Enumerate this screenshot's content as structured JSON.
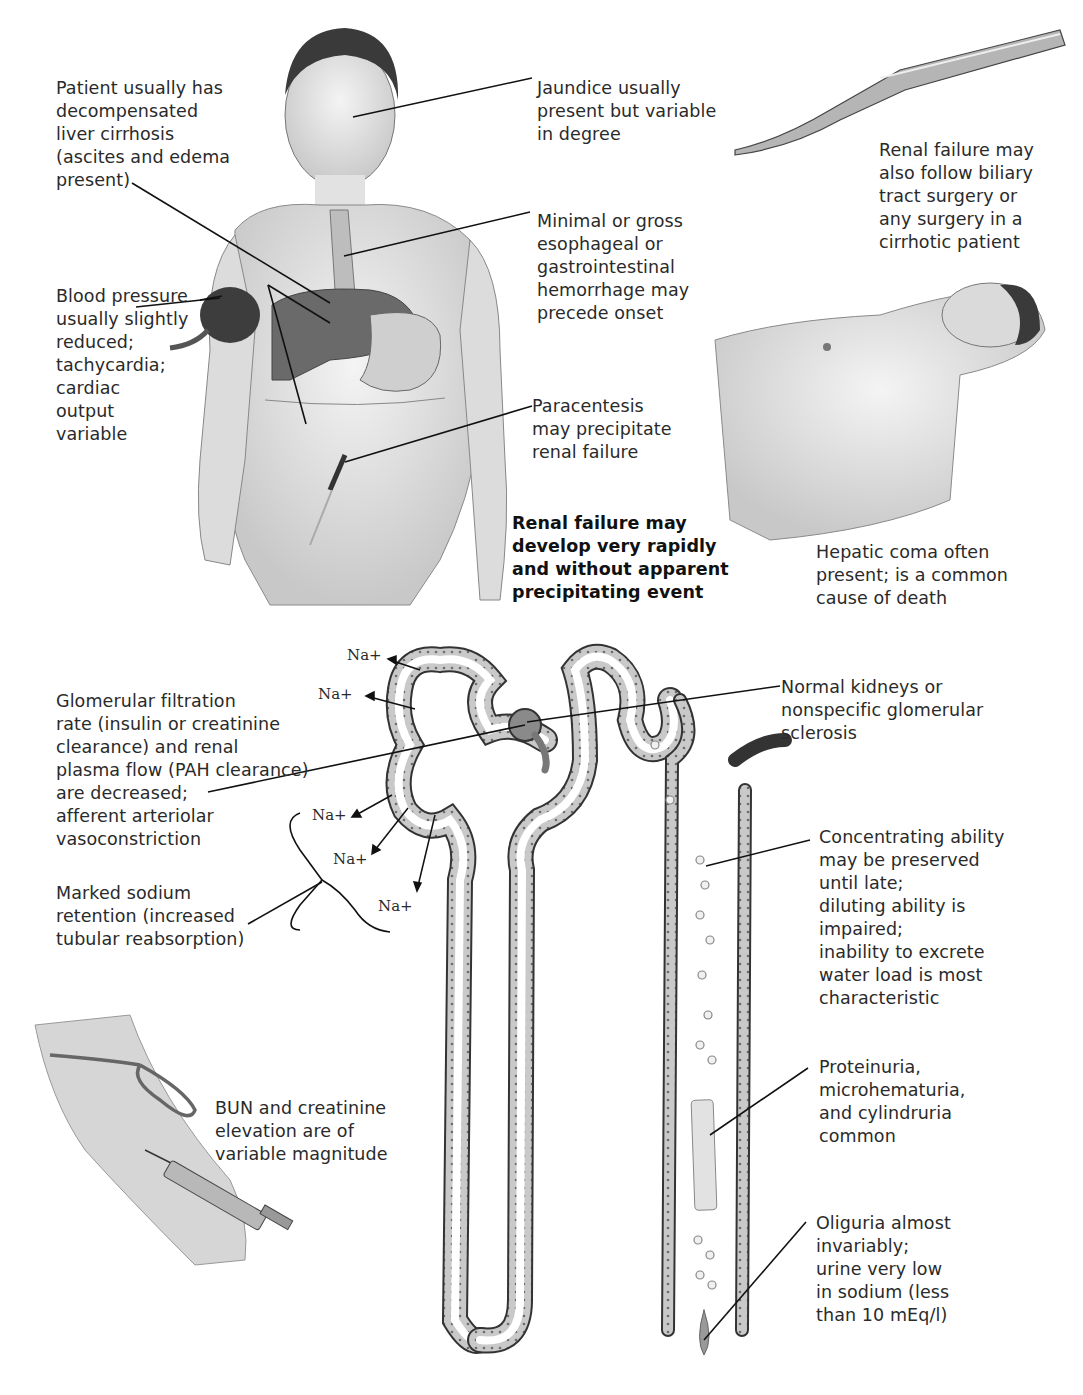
{
  "figure": {
    "topic": "Hepatorenal syndrome — clinical picture and nephron findings",
    "labels": {
      "cirrhosis": "Patient usually has\ndecompensated\nliver cirrhosis\n(ascites and edema\npresent)",
      "jaundice": "Jaundice usually\npresent but variable\nin degree",
      "surgery": "Renal failure may\nalso follow biliary\ntract surgery or\nany surgery in a\ncirrhotic patient",
      "hemorrhage": "Minimal or gross\nesophageal or\ngastrointestinal\nhemorrhage may\nprecede onset",
      "blood_pressure": "Blood pressure\nusually slightly\nreduced;\ntachycardia;\ncardiac\noutput\nvariable",
      "paracentesis": "Paracentesis\nmay precipitate\nrenal failure",
      "rapid_onset": "Renal failure may\ndevelop very rapidly\nand without apparent\nprecipitating event",
      "hepatic_coma": "Hepatic coma often\npresent; is a common\ncause of death",
      "gfr": "Glomerular filtration\nrate (insulin or creatinine\nclearance) and renal\nplasma flow (PAH clearance)\nare decreased;\nafferent arteriolar\nvasoconstriction",
      "normal_kidneys": "Normal kidneys or\nnonspecific glomerular\nsclerosis",
      "sodium_retention": "Marked sodium\nretention (increased\ntubular reabsorption)",
      "concentrating": "Concentrating ability\nmay be preserved\nuntil late;\ndiluting ability is\nimpaired;\ninability to excrete\nwater load is most\ncharacteristic",
      "bun": "BUN and creatinine\nelevation are of\nvariable magnitude",
      "proteinuria": "Proteinuria,\nmicrohematuria,\nand cylindruria\ncommon",
      "oliguria": "Oliguria almost\ninvariably;\nurine very low\nin sodium (less\nthan 10 mEq/l)"
    },
    "sodium_marker": "Na+",
    "illustrations": [
      "patient-standing",
      "scalpel",
      "patient-lying-coma",
      "nephron",
      "arm-with-syringe"
    ]
  }
}
